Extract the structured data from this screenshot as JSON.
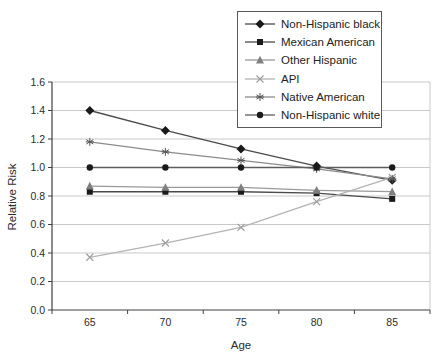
{
  "chart_data": {
    "type": "line",
    "title": "",
    "xlabel": "Age",
    "ylabel": "Relative Risk",
    "x": [
      65,
      70,
      75,
      80,
      85
    ],
    "ylim": [
      0.0,
      1.6
    ],
    "ytick_step": 0.2,
    "ytick_labels": [
      "0.0",
      "0.2",
      "0.4",
      "0.6",
      "0.8",
      "1.0",
      "1.2",
      "1.4",
      "1.6"
    ],
    "grid": true,
    "grid_color": "#c9c9c9",
    "axis_color": "#404040",
    "legend_position": "top-right",
    "legend_border_color": "#595959",
    "series": [
      {
        "name": "Non-Hispanic black",
        "marker": "diamond",
        "line_color": "#4a4a4a",
        "marker_color": "#1a1a1a",
        "values": [
          1.4,
          1.26,
          1.13,
          1.01,
          0.91
        ]
      },
      {
        "name": "Mexican American",
        "marker": "square",
        "line_color": "#4a4a4a",
        "marker_color": "#1a1a1a",
        "values": [
          0.83,
          0.83,
          0.83,
          0.82,
          0.78
        ]
      },
      {
        "name": "Other Hispanic",
        "marker": "triangle",
        "line_color": "#9a9a9a",
        "marker_color": "#7f7f7f",
        "values": [
          0.87,
          0.86,
          0.86,
          0.84,
          0.83
        ]
      },
      {
        "name": "API",
        "marker": "x",
        "line_color": "#b3b3b3",
        "marker_color": "#9e9e9e",
        "values": [
          0.37,
          0.47,
          0.58,
          0.76,
          0.93
        ]
      },
      {
        "name": "Native American",
        "marker": "asterisk",
        "line_color": "#8c8c8c",
        "marker_color": "#555555",
        "values": [
          1.18,
          1.11,
          1.05,
          0.99,
          0.92
        ]
      },
      {
        "name": "Non-Hispanic white",
        "marker": "circle",
        "line_color": "#5c5c5c",
        "marker_color": "#1a1a1a",
        "values": [
          1.0,
          1.0,
          1.0,
          1.0,
          1.0
        ]
      }
    ]
  }
}
